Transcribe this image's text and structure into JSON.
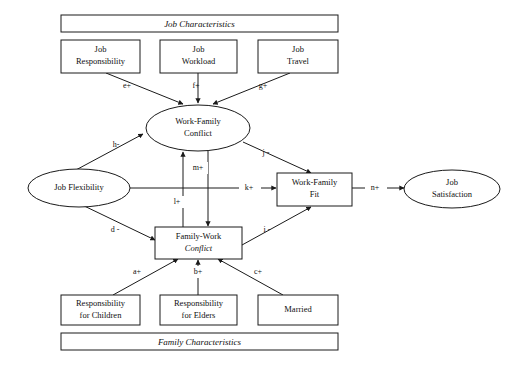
{
  "diagram": {
    "background_color": "#ffffff",
    "line_color": "#1a1a1a",
    "text_color": "#101010",
    "banners": [
      {
        "id": "job-characteristics",
        "label": "Job Characteristics"
      },
      {
        "id": "family-characteristics",
        "label": "Family Characteristics"
      }
    ],
    "nodes": [
      {
        "id": "job-responsibility",
        "shape": "rect",
        "line1": "Job",
        "line2": "Responsibility"
      },
      {
        "id": "job-workload",
        "shape": "rect",
        "line1": "Job",
        "line2": "Workload"
      },
      {
        "id": "job-travel",
        "shape": "rect",
        "line1": "Job",
        "line2": "Travel"
      },
      {
        "id": "work-family-conflict",
        "shape": "ellipse",
        "line1": "Work-Family",
        "line2": "Conflict"
      },
      {
        "id": "job-flexibility",
        "shape": "ellipse",
        "line1": "Job Flexibility",
        "line2": ""
      },
      {
        "id": "work-family-fit",
        "shape": "rect",
        "line1": "Work-Family",
        "line2": "Fit"
      },
      {
        "id": "job-satisfaction",
        "shape": "ellipse",
        "line1": "Job",
        "line2": "Satisfaction"
      },
      {
        "id": "family-work-conflict",
        "shape": "rect",
        "line1": "Family-Work",
        "line2": "Conflict"
      },
      {
        "id": "responsibility-for-children",
        "shape": "rect",
        "line1": "Responsibility",
        "line2": "for Children"
      },
      {
        "id": "responsibility-for-elders",
        "shape": "rect",
        "line1": "Responsibility",
        "line2": "for Elders"
      },
      {
        "id": "married",
        "shape": "rect",
        "line1": "Married",
        "line2": ""
      }
    ],
    "edges": [
      {
        "id": "edge-a",
        "label": "a+",
        "from": "responsibility-for-children",
        "to": "family-work-conflict",
        "sign": "+"
      },
      {
        "id": "edge-b",
        "label": "b+",
        "from": "responsibility-for-elders",
        "to": "family-work-conflict",
        "sign": "+"
      },
      {
        "id": "edge-c",
        "label": "c+",
        "from": "married",
        "to": "family-work-conflict",
        "sign": "+"
      },
      {
        "id": "edge-d",
        "label": "d -",
        "from": "job-flexibility",
        "to": "family-work-conflict",
        "sign": "-"
      },
      {
        "id": "edge-e",
        "label": "e+",
        "from": "job-responsibility",
        "to": "work-family-conflict",
        "sign": "+"
      },
      {
        "id": "edge-f",
        "label": "f+",
        "from": "job-workload",
        "to": "work-family-conflict",
        "sign": "+"
      },
      {
        "id": "edge-g",
        "label": "g+",
        "from": "job-travel",
        "to": "work-family-conflict",
        "sign": "+"
      },
      {
        "id": "edge-h",
        "label": "h-",
        "from": "job-flexibility",
        "to": "work-family-conflict",
        "sign": "-"
      },
      {
        "id": "edge-i",
        "label": "i -",
        "from": "family-work-conflict",
        "to": "work-family-fit",
        "sign": "-"
      },
      {
        "id": "edge-j",
        "label": "j -",
        "from": "work-family-conflict",
        "to": "work-family-fit",
        "sign": "-"
      },
      {
        "id": "edge-k",
        "label": "k+",
        "from": "job-flexibility",
        "to": "work-family-fit",
        "sign": "+"
      },
      {
        "id": "edge-l",
        "label": "l+",
        "from": "family-work-conflict",
        "to": "work-family-conflict",
        "sign": "+"
      },
      {
        "id": "edge-m",
        "label": "m+",
        "from": "work-family-conflict",
        "to": "family-work-conflict",
        "sign": "+"
      },
      {
        "id": "edge-n",
        "label": "n+",
        "from": "work-family-fit",
        "to": "job-satisfaction",
        "sign": "+"
      }
    ]
  }
}
